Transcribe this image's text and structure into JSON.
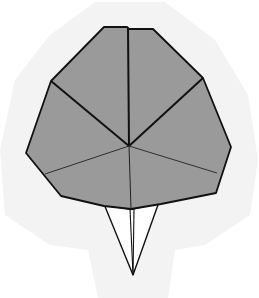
{
  "diagram": {
    "colors": {
      "background": "#ffffff",
      "halo": "#f3f3f3",
      "face_fill": "#9a9a9a",
      "stem_fill": "#ffffff",
      "stroke": "#111111"
    },
    "center": [
      129,
      146
    ],
    "outline": [
      [
        104,
        27
      ],
      [
        127,
        27
      ],
      [
        129,
        29
      ],
      [
        153,
        29
      ],
      [
        203,
        78
      ],
      [
        231,
        147
      ],
      [
        216,
        193
      ],
      [
        161,
        204
      ],
      [
        131,
        209
      ],
      [
        104,
        206
      ],
      [
        61,
        196
      ],
      [
        26,
        153
      ],
      [
        51,
        81
      ]
    ],
    "creases": [
      {
        "from": [
          129,
          146
        ],
        "to": [
          128,
          28
        ],
        "weight": "thick"
      },
      {
        "from": [
          129,
          146
        ],
        "to": [
          51,
          81
        ],
        "weight": "thick"
      },
      {
        "from": [
          129,
          146
        ],
        "to": [
          203,
          78
        ],
        "weight": "thick"
      },
      {
        "from": [
          129,
          146
        ],
        "to": [
          45,
          174
        ],
        "weight": "thin"
      },
      {
        "from": [
          129,
          146
        ],
        "to": [
          217,
          173
        ],
        "weight": "thin"
      },
      {
        "from": [
          129,
          146
        ],
        "to": [
          131,
          209
        ],
        "weight": "thin"
      }
    ],
    "stem": {
      "left": [
        104,
        204
      ],
      "right": [
        159,
        202
      ],
      "tip": [
        133,
        275
      ],
      "inner": [
        [
          130,
          209
        ],
        [
          134,
          209
        ]
      ]
    }
  }
}
